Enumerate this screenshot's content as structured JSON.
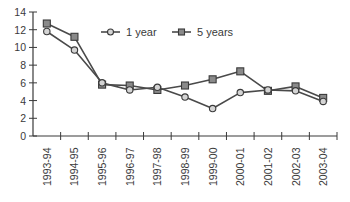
{
  "chart_data": {
    "type": "line",
    "title": "",
    "xlabel": "",
    "ylabel": "",
    "ylim": [
      0,
      14
    ],
    "yticks": [
      0,
      2,
      4,
      6,
      8,
      10,
      12,
      14
    ],
    "grid": false,
    "legend_position": "top-center (inside plot)",
    "categories": [
      "1993-94",
      "1994-95",
      "1995-96",
      "1996-97",
      "1997-98",
      "1998-99",
      "1999-00",
      "2000-01",
      "2001-02",
      "2002-03",
      "2003-04"
    ],
    "series": [
      {
        "name": "1 year",
        "marker": "circle",
        "values": [
          11.8,
          9.7,
          6.0,
          5.2,
          5.5,
          4.4,
          3.1,
          4.9,
          5.2,
          5.1,
          3.9
        ]
      },
      {
        "name": "5 years",
        "marker": "square",
        "values": [
          12.7,
          11.2,
          5.8,
          5.7,
          5.2,
          5.7,
          6.4,
          7.3,
          5.1,
          5.6,
          4.3
        ]
      }
    ]
  },
  "colors": {
    "axis": "#3a3a3a",
    "line": "#4a4a4a",
    "circle_fill": "#d4d4d4",
    "square_fill": "#8a8a8a",
    "marker_stroke": "#3a3a3a"
  },
  "legend": {
    "items": [
      {
        "label": "1 year",
        "marker": "circle"
      },
      {
        "label": "5 years",
        "marker": "square"
      }
    ]
  }
}
